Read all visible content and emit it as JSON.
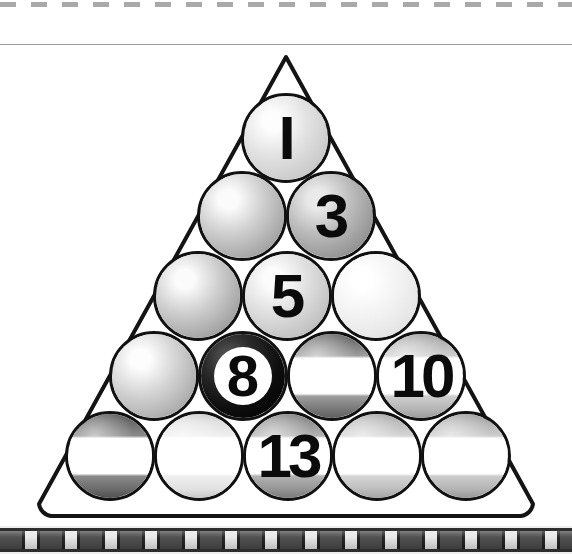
{
  "page": {
    "background_color": "#ffffff",
    "width": 572,
    "height": 554
  },
  "decorations": {
    "top_dashed_rule": {
      "name": "dashed-rule",
      "color": "#9a9a9a",
      "y": 2
    },
    "top_hairline_rule": {
      "name": "hairline-rule",
      "color": "#9e9e9e",
      "y": 44
    },
    "bottom_film_strip": {
      "name": "film-strip-border",
      "dark_color": "#4a4a4a",
      "light_color": "#e8e8e8",
      "rail_color": "#2e2e2e",
      "y": 526
    }
  },
  "rack": {
    "name": "triangle-rack",
    "outline_color": "#141414",
    "apex": {
      "x": 286,
      "y": 11
    },
    "bottom_left": {
      "x": 36,
      "y": 467
    },
    "bottom_right": {
      "x": 536,
      "y": 467
    },
    "rows": 5,
    "ball_count": 15,
    "ball_diameter": 90
  },
  "balls": [
    {
      "id": "ball-1",
      "label": "I",
      "number": 1,
      "type": "solid",
      "row": 1,
      "col": 1,
      "cx": 286,
      "cy": 92,
      "colors": {
        "highlight": "#fdfdfd",
        "mid": "#e3e3e3",
        "base": "#cccccc",
        "edge": "#a9a9a9"
      },
      "num_class": "big"
    },
    {
      "id": "ball-r2c1",
      "label": "",
      "number": null,
      "type": "solid",
      "row": 2,
      "col": 1,
      "cx": 242,
      "cy": 170,
      "colors": {
        "highlight": "#fbfbfb",
        "mid": "#d0d0d0",
        "base": "#a8a8a8",
        "edge": "#848484"
      },
      "num_class": "big"
    },
    {
      "id": "ball-3",
      "label": "3",
      "number": 3,
      "type": "solid",
      "row": 2,
      "col": 2,
      "cx": 331,
      "cy": 170,
      "colors": {
        "highlight": "#e9e9e9",
        "mid": "#bcbcbc",
        "base": "#979797",
        "edge": "#777777"
      },
      "num_class": "big"
    },
    {
      "id": "ball-r3c1",
      "label": "",
      "number": null,
      "type": "solid",
      "row": 3,
      "col": 1,
      "cx": 198,
      "cy": 250,
      "colors": {
        "highlight": "#fbfbfb",
        "mid": "#cfcfcf",
        "base": "#a6a6a6",
        "edge": "#828282"
      },
      "num_class": "big"
    },
    {
      "id": "ball-5",
      "label": "5",
      "number": 5,
      "type": "solid",
      "row": 3,
      "col": 2,
      "cx": 287,
      "cy": 250,
      "colors": {
        "highlight": "#fcfcfc",
        "mid": "#e0e0e0",
        "base": "#c4c4c4",
        "edge": "#a2a2a2"
      },
      "num_class": "big"
    },
    {
      "id": "ball-r3c3",
      "label": "",
      "number": null,
      "type": "solid",
      "row": 3,
      "col": 3,
      "cx": 376,
      "cy": 250,
      "colors": {
        "highlight": "#ffffff",
        "mid": "#f4f4f4",
        "base": "#e6e6e6",
        "edge": "#c9c9c9"
      },
      "num_class": "big"
    },
    {
      "id": "ball-r4c1",
      "label": "",
      "number": null,
      "type": "solid",
      "row": 4,
      "col": 1,
      "cx": 154,
      "cy": 330,
      "colors": {
        "highlight": "#fdfdfd",
        "mid": "#d6d6d6",
        "base": "#b0b0b0",
        "edge": "#8c8c8c"
      },
      "num_class": "big"
    },
    {
      "id": "ball-8",
      "label": "8",
      "number": 8,
      "type": "eight",
      "row": 4,
      "col": 2,
      "cx": 243,
      "cy": 330,
      "colors": {
        "highlight": "#5a5a5a",
        "mid": "#2a2a2a",
        "base": "#0d0d0d",
        "edge": "#000000"
      },
      "num_class": "eight"
    },
    {
      "id": "ball-r4c3",
      "label": "",
      "number": null,
      "type": "stripe",
      "row": 4,
      "col": 3,
      "cx": 332,
      "cy": 330,
      "colors": {
        "highlight": "#f2f2f2",
        "mid": "#9e9e9e",
        "base": "#767676",
        "edge": "#5e5e5e"
      },
      "num_class": "big"
    },
    {
      "id": "ball-10",
      "label": "10",
      "number": 10,
      "type": "stripe",
      "row": 4,
      "col": 4,
      "cx": 421,
      "cy": 330,
      "colors": {
        "highlight": "#fafafa",
        "mid": "#cfcfcf",
        "base": "#b4b4b4",
        "edge": "#9a9a9a"
      },
      "num_class": "double"
    },
    {
      "id": "ball-r5c1",
      "label": "",
      "number": null,
      "type": "stripe",
      "row": 5,
      "col": 1,
      "cx": 110,
      "cy": 410,
      "colors": {
        "highlight": "#e6e6e6",
        "mid": "#8a8a8a",
        "base": "#6a6a6a",
        "edge": "#4f4f4f"
      },
      "num_class": "big"
    },
    {
      "id": "ball-r5c2",
      "label": "",
      "number": null,
      "type": "stripe",
      "row": 5,
      "col": 2,
      "cx": 199,
      "cy": 410,
      "colors": {
        "highlight": "#ffffff",
        "mid": "#efefef",
        "base": "#e0e0e0",
        "edge": "#c8c8c8"
      },
      "num_class": "big"
    },
    {
      "id": "ball-13",
      "label": "13",
      "number": 13,
      "type": "stripe",
      "row": 5,
      "col": 3,
      "cx": 288,
      "cy": 410,
      "colors": {
        "highlight": "#ececec",
        "mid": "#b2b2b2",
        "base": "#949494",
        "edge": "#7a7a7a"
      },
      "num_class": "double"
    },
    {
      "id": "ball-r5c4",
      "label": "",
      "number": null,
      "type": "stripe",
      "row": 5,
      "col": 4,
      "cx": 377,
      "cy": 410,
      "colors": {
        "highlight": "#fafafa",
        "mid": "#d5d5d5",
        "base": "#bcbcbc",
        "edge": "#a4a4a4"
      },
      "num_class": "big"
    },
    {
      "id": "ball-r5c5",
      "label": "",
      "number": null,
      "type": "stripe",
      "row": 5,
      "col": 5,
      "cx": 466,
      "cy": 410,
      "colors": {
        "highlight": "#f8f8f8",
        "mid": "#cdcdcd",
        "base": "#b2b2b2",
        "edge": "#999999"
      },
      "num_class": "big"
    }
  ]
}
